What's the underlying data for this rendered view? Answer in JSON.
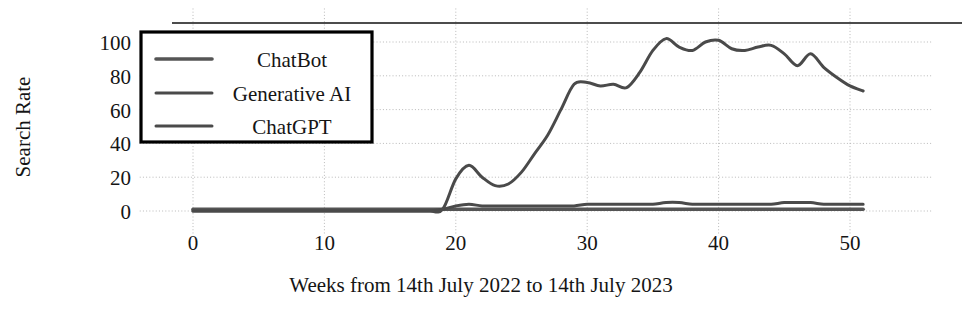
{
  "chart_data": {
    "type": "line",
    "title": "",
    "subtitle": "",
    "xlabel": "Weeks from 14th July 2022 to 14th July 2023",
    "ylabel": "Search Rate",
    "xlim": [
      -2,
      53
    ],
    "ylim": [
      -4,
      108
    ],
    "xticks": [
      0,
      10,
      20,
      30,
      40,
      50
    ],
    "yticks": [
      0,
      20,
      40,
      60,
      80,
      100
    ],
    "xtick_labels": [
      "0",
      "10",
      "20",
      "30",
      "40",
      "50"
    ],
    "ytick_labels": [
      "0",
      "20",
      "40",
      "60",
      "80",
      "100"
    ],
    "grid": true,
    "grid_style": "dotted",
    "legend_position": "upper-left-inset",
    "legend_entries": [
      "ChatBot",
      "Generative AI",
      "ChatGPT"
    ],
    "x": [
      0,
      1,
      2,
      3,
      4,
      5,
      6,
      7,
      8,
      9,
      10,
      11,
      12,
      13,
      14,
      15,
      16,
      17,
      18,
      19,
      20,
      21,
      22,
      23,
      24,
      25,
      26,
      27,
      28,
      29,
      30,
      31,
      32,
      33,
      34,
      35,
      36,
      37,
      38,
      39,
      40,
      41,
      42,
      43,
      44,
      45,
      46,
      47,
      48,
      49,
      50,
      51
    ],
    "series": [
      {
        "name": "ChatBot",
        "color": "#555555",
        "values": [
          1,
          1,
          1,
          1,
          1,
          1,
          1,
          1,
          1,
          1,
          1,
          1,
          1,
          1,
          1,
          1,
          1,
          1,
          1,
          1,
          1,
          1,
          1,
          1,
          1,
          1,
          1,
          1,
          1,
          1,
          1,
          1,
          1,
          1,
          1,
          1,
          1,
          1,
          1,
          1,
          1,
          1,
          1,
          1,
          1,
          1,
          1,
          1,
          1,
          1,
          1,
          1
        ]
      },
      {
        "name": "Generative AI",
        "color": "#4a4a4a",
        "values": [
          0,
          0,
          0,
          0,
          0,
          0,
          0,
          0,
          0,
          0,
          0,
          0,
          0,
          0,
          0,
          0,
          0,
          0,
          0,
          1,
          3,
          4,
          3,
          3,
          3,
          3,
          3,
          3,
          3,
          3,
          4,
          4,
          4,
          4,
          4,
          4,
          5,
          5,
          4,
          4,
          4,
          4,
          4,
          4,
          4,
          5,
          5,
          5,
          4,
          4,
          4,
          4
        ]
      },
      {
        "name": "ChatGPT",
        "color": "#4a4a4a",
        "values": [
          0,
          0,
          0,
          0,
          0,
          0,
          0,
          0,
          0,
          0,
          0,
          0,
          0,
          0,
          0,
          0,
          0,
          0,
          0,
          1,
          19,
          27,
          20,
          15,
          16,
          23,
          34,
          45,
          60,
          75,
          76,
          74,
          75,
          73,
          82,
          95,
          102,
          97,
          95,
          100,
          101,
          96,
          95,
          97,
          98,
          93,
          86,
          93,
          85,
          79,
          74,
          71
        ]
      }
    ]
  },
  "axes": {
    "ylabel": "Search Rate",
    "xlabel": "Weeks from 14th July 2022 to 14th July 2023"
  },
  "legend": {
    "items": [
      {
        "label": "ChatBot"
      },
      {
        "label": "Generative AI"
      },
      {
        "label": "ChatGPT"
      }
    ]
  }
}
